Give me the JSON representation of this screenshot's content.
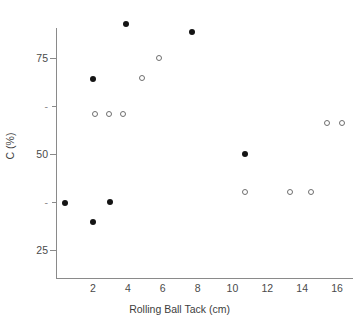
{
  "chart_data": {
    "type": "scatter",
    "title": "",
    "xlabel": "Rolling Ball Tack (cm)",
    "ylabel": "C (%)",
    "xlim": [
      0,
      17.4
    ],
    "ylim": [
      20,
      90
    ],
    "grid": false,
    "legend": "none",
    "x_ticks": [
      2,
      4,
      6,
      8,
      10,
      12,
      14,
      16
    ],
    "x_tick_labels": [
      "2",
      "4",
      "6",
      "8",
      "10",
      "12",
      "14",
      "16"
    ],
    "y_ticks": [
      75,
      62.5,
      50,
      37.5,
      25
    ],
    "y_tick_labels": [
      "75",
      "-",
      "50",
      "-",
      "25"
    ],
    "series": [
      {
        "name": "filled",
        "marker": "filled-circle",
        "color": "#141414",
        "points": [
          {
            "x": 3.9,
            "y": 83.8
          },
          {
            "x": 7.7,
            "y": 81.7
          },
          {
            "x": 2.0,
            "y": 69.5
          },
          {
            "x": 10.7,
            "y": 50.0
          },
          {
            "x": 3.0,
            "y": 37.4
          },
          {
            "x": 0.4,
            "y": 37.2
          },
          {
            "x": 2.0,
            "y": 32.3
          }
        ]
      },
      {
        "name": "open",
        "marker": "open-circle",
        "color": "#6f6f6f",
        "points": [
          {
            "x": 5.8,
            "y": 75.0
          },
          {
            "x": 4.8,
            "y": 69.9
          },
          {
            "x": 2.1,
            "y": 60.4
          },
          {
            "x": 2.9,
            "y": 60.4
          },
          {
            "x": 3.7,
            "y": 60.4
          },
          {
            "x": 15.4,
            "y": 58.0
          },
          {
            "x": 16.3,
            "y": 58.0
          },
          {
            "x": 10.7,
            "y": 40.1
          },
          {
            "x": 13.3,
            "y": 40.1
          },
          {
            "x": 14.5,
            "y": 40.1
          }
        ]
      }
    ]
  },
  "axes": {
    "x_title": "Rolling Ball Tack (cm)",
    "y_title": "C (%)"
  }
}
